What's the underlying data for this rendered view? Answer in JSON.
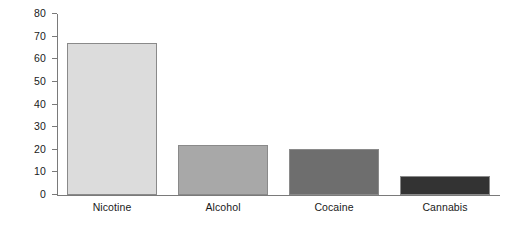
{
  "chart_data": {
    "type": "bar",
    "title": "",
    "subtitle": "",
    "xlabel": "",
    "ylabel": "",
    "categories": [
      "Nicotine",
      "Alcohol",
      "Cocaine",
      "Cannabis"
    ],
    "values": [
      67,
      22,
      20.5,
      8.5
    ],
    "ylim": [
      0,
      80
    ],
    "yticks": [
      0,
      10,
      20,
      30,
      40,
      50,
      60,
      70,
      80
    ],
    "ytick_labels": [
      "0",
      "10",
      "20",
      "30",
      "40",
      "50",
      "60",
      "70",
      "80"
    ],
    "grid": false,
    "legend": false,
    "legend_position": "none",
    "bar_colors": [
      "#dcdcdc",
      "#a8a8a8",
      "#6e6e6e",
      "#333333"
    ],
    "bar_border_color": "#8a8a8a",
    "axis_color": "#7a7a7a",
    "background_color": "#ffffff",
    "bars": [
      {
        "category": "Nicotine",
        "value": 67,
        "color": "#dcdcdc"
      },
      {
        "category": "Alcohol",
        "value": 22,
        "color": "#a8a8a8"
      },
      {
        "category": "Cocaine",
        "value": 20.5,
        "color": "#6e6e6e"
      },
      {
        "category": "Cannabis",
        "value": 8.5,
        "color": "#333333"
      }
    ]
  }
}
